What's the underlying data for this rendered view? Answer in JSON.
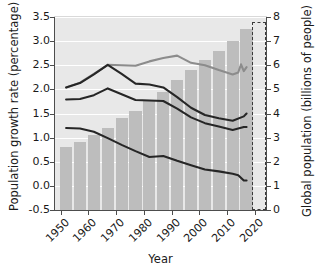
{
  "chart_data": {
    "type": "bar",
    "title": "",
    "xlabel": "Year",
    "ylabel": "Population growth rate (percentage)",
    "ylabel_right": "Global population (billions of people)",
    "xlim": [
      1948,
      2024
    ],
    "ylim": [
      -0.5,
      3.5
    ],
    "ylim_right": [
      0,
      8
    ],
    "yticks": [
      "3.5",
      "3.0",
      "2.5",
      "2.0",
      "1.5",
      "1.0",
      "0.5",
      "0.0",
      "-0.5"
    ],
    "ytick_values": [
      3.5,
      3.0,
      2.5,
      2.0,
      1.5,
      1.0,
      0.5,
      0.0,
      -0.5
    ],
    "yticks_right": [
      "8",
      "7",
      "6",
      "5",
      "4",
      "3",
      "2",
      "1",
      "0"
    ],
    "ytick_right_values": [
      8,
      7,
      6,
      5,
      4,
      3,
      2,
      1,
      0
    ],
    "xticks": [
      "1950",
      "1960",
      "1970",
      "1980",
      "1990",
      "2000",
      "2010",
      "2020"
    ],
    "xtick_values": [
      1950,
      1960,
      1970,
      1980,
      1990,
      2000,
      2010,
      2020
    ],
    "grid": "horizontal",
    "legend": "none",
    "plot_bg_color": "#e8e8e8",
    "bar_color": "#bdbdbd",
    "bars": {
      "name": "Global population",
      "axis": "right",
      "unit": "billions of people",
      "x": [
        1952,
        1957,
        1962,
        1967,
        1972,
        1977,
        1982,
        1987,
        1992,
        1997,
        2002,
        2007,
        2012,
        2017
      ],
      "values": [
        2.6,
        2.8,
        3.1,
        3.4,
        3.8,
        4.1,
        4.5,
        4.9,
        5.4,
        5.8,
        6.2,
        6.6,
        7.0,
        7.5
      ]
    },
    "series": [
      {
        "name": "Upper growth line",
        "axis": "left",
        "color": "#8c8c8c",
        "unit": "percentage",
        "x": [
          1952,
          1957,
          1962,
          1967,
          1972,
          1977,
          1982,
          1987,
          1992,
          1997,
          2002,
          2007,
          2012,
          2014,
          2015,
          2016,
          2017
        ],
        "values": [
          2.04,
          2.14,
          2.32,
          2.51,
          2.5,
          2.49,
          2.58,
          2.65,
          2.7,
          2.55,
          2.5,
          2.4,
          2.31,
          2.35,
          2.52,
          2.38,
          2.46
        ]
      },
      {
        "name": "Middle growth line",
        "axis": "left",
        "color": "#262626",
        "unit": "percentage",
        "x": [
          1952,
          1957,
          1962,
          1967,
          1972,
          1977,
          1982,
          1987,
          1992,
          1997,
          2002,
          2007,
          2012,
          2016,
          2017
        ],
        "values": [
          2.04,
          2.13,
          2.31,
          2.51,
          2.32,
          2.12,
          2.1,
          2.04,
          1.84,
          1.62,
          1.47,
          1.4,
          1.35,
          1.44,
          1.5
        ]
      },
      {
        "name": "Lower-middle growth line",
        "axis": "left",
        "color": "#262626",
        "unit": "percentage",
        "x": [
          1952,
          1957,
          1962,
          1967,
          1972,
          1977,
          1982,
          1987,
          1992,
          1997,
          2002,
          2007,
          2012,
          2016,
          2017
        ],
        "values": [
          1.79,
          1.8,
          1.88,
          2.02,
          1.9,
          1.78,
          1.77,
          1.76,
          1.6,
          1.42,
          1.3,
          1.23,
          1.16,
          1.22,
          1.22
        ]
      },
      {
        "name": "Bottom growth line",
        "axis": "left",
        "color": "#262626",
        "unit": "percentage",
        "x": [
          1952,
          1957,
          1962,
          1967,
          1972,
          1977,
          1982,
          1987,
          1992,
          1997,
          2002,
          2007,
          2012,
          2014,
          2016,
          2017
        ],
        "values": [
          1.2,
          1.19,
          1.12,
          0.99,
          0.85,
          0.72,
          0.6,
          0.62,
          0.52,
          0.43,
          0.34,
          0.3,
          0.25,
          0.22,
          0.11,
          0.11
        ]
      }
    ],
    "annotations": [
      {
        "name": "projection-box",
        "type": "dashed-rectangle",
        "x_start": 2019,
        "x_end": 2024,
        "description": "dashed box marking projected period near 2020"
      }
    ]
  }
}
